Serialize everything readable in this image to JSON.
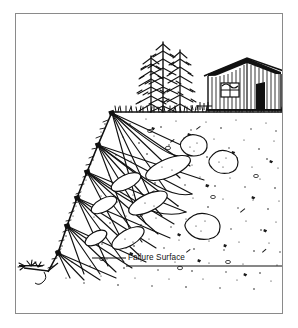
{
  "figure": {
    "domain": "diagram",
    "type": "engineering-cross-section",
    "frame": {
      "border_color": "#8a8a8a",
      "background_color": "#ffffff",
      "x": 15,
      "y": 13,
      "width": 268,
      "height": 301
    },
    "ink_color": "#111111"
  },
  "labels": {
    "failure_surface": "Failure Surface"
  },
  "annotations": {
    "leader_line": {
      "from_x": 92,
      "from_y": 258,
      "to_x": 126,
      "to_y": 258
    }
  },
  "scene": {
    "ground_line_y": 112,
    "slope_crest": {
      "x": 112,
      "y": 112
    },
    "slope_toe": {
      "x": 57,
      "y": 262
    },
    "trees": [
      {
        "name": "conifer-left",
        "base_x": 151,
        "base_y": 112,
        "height": 58,
        "half_width": 13
      },
      {
        "name": "conifer-center",
        "base_x": 163,
        "base_y": 112,
        "height": 72,
        "half_width": 15
      },
      {
        "name": "conifer-right",
        "base_x": 180,
        "base_y": 112,
        "height": 64,
        "half_width": 13
      }
    ],
    "barn": {
      "name": "barn",
      "left_x": 208,
      "right_x": 281,
      "eave_y": 72,
      "base_y": 110,
      "ridge_x": 247,
      "ridge_y": 59,
      "siding_boards": 22,
      "window": {
        "x": 222,
        "y": 84,
        "w": 17,
        "h": 13
      },
      "door": {
        "x": 256,
        "y": 84,
        "w": 9,
        "h": 24
      }
    },
    "failure_nodes": [
      {
        "x": 112,
        "y": 113
      },
      {
        "x": 98,
        "y": 145
      },
      {
        "x": 87,
        "y": 172
      },
      {
        "x": 77,
        "y": 198
      },
      {
        "x": 67,
        "y": 226
      },
      {
        "x": 58,
        "y": 253
      }
    ],
    "boulders_count": 9,
    "stipple_density": "heavy"
  }
}
